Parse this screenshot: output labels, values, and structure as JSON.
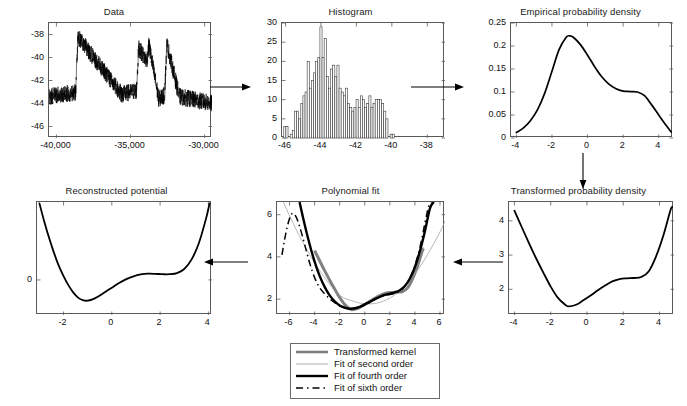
{
  "figure": {
    "kind": "pipeline-figure",
    "background": "#ffffff",
    "line_color": "#000000",
    "axis_color": "#5a5a5a"
  },
  "arrows": [
    {
      "name": "arrow-data-to-histogram",
      "direction": "right"
    },
    {
      "name": "arrow-histogram-to-empirical",
      "direction": "right"
    },
    {
      "name": "arrow-empirical-to-transformed",
      "direction": "down"
    },
    {
      "name": "arrow-transformed-to-polynomial",
      "direction": "left"
    },
    {
      "name": "arrow-polynomial-to-reconstructed",
      "direction": "left"
    }
  ],
  "legend": {
    "name": "polynomial-fit-legend",
    "entries": [
      {
        "label": "Transformed kernel",
        "style": "thick-gray",
        "color": "#777777"
      },
      {
        "label": "Fit of second order",
        "style": "thin-gray",
        "color": "#999999"
      },
      {
        "label": "Fit of fourth order",
        "style": "thick-black",
        "color": "#000000"
      },
      {
        "label": "Fit of sixth order",
        "style": "dashed-black",
        "color": "#000000"
      }
    ]
  },
  "chart_data": [
    {
      "id": "data",
      "type": "line",
      "title": "Data",
      "xlabel": "",
      "ylabel": "",
      "xlim": [
        -40500,
        -29500
      ],
      "ylim": [
        -47,
        -37
      ],
      "xticks": [
        -40000,
        -35000,
        -30000
      ],
      "xticklabels": [
        "-40,000",
        "-35,000",
        "-30,000"
      ],
      "yticks": [
        -46,
        -44,
        -42,
        -40,
        -38
      ],
      "yticklabels": [
        "-46",
        "-44",
        "-42",
        "-40",
        "-38"
      ],
      "grid": false,
      "description": "Noisy bistable time series switching between a lower level near -43.5 and an upper level near -39",
      "noise_amplitude": 0.75,
      "segments": [
        {
          "x0": -40500,
          "x1": -38700,
          "y0": -43.4,
          "y1": -43.0
        },
        {
          "x0": -38700,
          "x1": -38550,
          "y0": -43.0,
          "y1": -38.2
        },
        {
          "x0": -38550,
          "x1": -35600,
          "y0": -38.2,
          "y1": -43.2
        },
        {
          "x0": -35600,
          "x1": -34600,
          "y0": -43.2,
          "y1": -42.9
        },
        {
          "x0": -34600,
          "x1": -34450,
          "y0": -42.9,
          "y1": -39.2
        },
        {
          "x0": -34450,
          "x1": -33900,
          "y0": -39.2,
          "y1": -40.3
        },
        {
          "x0": -33900,
          "x1": -33750,
          "y0": -40.3,
          "y1": -38.9
        },
        {
          "x0": -33750,
          "x1": -33100,
          "y0": -38.9,
          "y1": -43.6
        },
        {
          "x0": -33100,
          "x1": -32700,
          "y0": -43.6,
          "y1": -43.3
        },
        {
          "x0": -32700,
          "x1": -32550,
          "y0": -43.3,
          "y1": -38.8
        },
        {
          "x0": -32550,
          "x1": -31700,
          "y0": -38.8,
          "y1": -43.4
        },
        {
          "x0": -31700,
          "x1": -29500,
          "y0": -43.4,
          "y1": -44.0
        }
      ]
    },
    {
      "id": "histogram",
      "type": "bar",
      "title": "Histogram",
      "xlabel": "",
      "ylabel": "",
      "xlim": [
        -46.2,
        -37.0
      ],
      "ylim": [
        0,
        30
      ],
      "xticks": [
        -46,
        -44,
        -42,
        -40,
        -38
      ],
      "xticklabels": [
        "-46",
        "-44",
        "-42",
        "-40",
        "-38"
      ],
      "yticks": [
        0,
        5,
        10,
        15,
        20,
        25,
        30
      ],
      "yticklabels": [
        "0",
        "5",
        "10",
        "15",
        "20",
        "25",
        "30"
      ],
      "grid": false,
      "bin_width": 0.12,
      "bin_start": -46.1,
      "values": [
        3,
        3,
        0,
        1,
        2,
        7,
        7,
        5,
        9,
        11,
        12,
        20,
        13,
        15,
        17,
        20,
        21,
        29,
        21,
        26,
        16,
        13,
        18,
        19,
        16,
        19,
        13,
        12,
        11,
        13,
        9,
        8,
        7,
        8,
        10,
        8,
        11,
        10,
        8,
        9,
        11,
        8,
        9,
        10,
        10,
        10,
        9,
        7,
        5,
        0,
        1,
        1
      ]
    },
    {
      "id": "empirical-probability-density",
      "type": "line",
      "title": "Empirical probability density",
      "xlabel": "",
      "ylabel": "",
      "xlim": [
        -4.3,
        4.8
      ],
      "ylim": [
        0,
        0.25
      ],
      "xticks": [
        -4,
        -2,
        0,
        2,
        4
      ],
      "xticklabels": [
        "-4",
        "-2",
        "0",
        "2",
        "4"
      ],
      "yticks": [
        0,
        0.05,
        0.1,
        0.15,
        0.2,
        0.25
      ],
      "yticklabels": [
        "0",
        "0.05",
        "0.1",
        "0.15",
        "0.2",
        "0.25"
      ],
      "grid": false,
      "x": [
        -4.0,
        -3.6,
        -3.2,
        -2.8,
        -2.4,
        -2.0,
        -1.6,
        -1.2,
        -1.0,
        -0.8,
        -0.4,
        0.0,
        0.4,
        0.8,
        1.2,
        1.6,
        2.0,
        2.4,
        2.8,
        3.2,
        3.6,
        4.0,
        4.4,
        4.7
      ],
      "y": [
        0.012,
        0.022,
        0.038,
        0.062,
        0.098,
        0.145,
        0.192,
        0.219,
        0.222,
        0.219,
        0.203,
        0.18,
        0.155,
        0.133,
        0.117,
        0.107,
        0.102,
        0.101,
        0.1,
        0.092,
        0.072,
        0.05,
        0.028,
        0.013
      ]
    },
    {
      "id": "transformed-probability-density",
      "type": "line",
      "title": "Transformed probability density",
      "xlabel": "",
      "ylabel": "",
      "xlim": [
        -4.3,
        4.8
      ],
      "ylim": [
        1.25,
        4.55
      ],
      "xticks": [
        -4,
        -2,
        0,
        2,
        4
      ],
      "xticklabels": [
        "-4",
        "-2",
        "0",
        "2",
        "4"
      ],
      "yticks": [
        2,
        3,
        4
      ],
      "yticklabels": [
        "2",
        "3",
        "4"
      ],
      "grid": false,
      "x": [
        -4.0,
        -3.6,
        -3.2,
        -2.8,
        -2.4,
        -2.0,
        -1.6,
        -1.2,
        -1.0,
        -0.6,
        -0.2,
        0.2,
        0.6,
        1.0,
        1.4,
        1.8,
        2.2,
        2.6,
        3.0,
        3.4,
        3.8,
        4.2,
        4.6,
        4.7
      ],
      "y": [
        4.3,
        3.82,
        3.35,
        2.9,
        2.48,
        2.08,
        1.75,
        1.55,
        1.5,
        1.55,
        1.68,
        1.82,
        1.97,
        2.11,
        2.23,
        2.3,
        2.32,
        2.33,
        2.36,
        2.52,
        2.95,
        3.55,
        4.3,
        4.4
      ]
    },
    {
      "id": "polynomial-fit",
      "type": "line",
      "title": "Polynomial fit",
      "xlabel": "",
      "ylabel": "",
      "xlim": [
        -7.0,
        6.4
      ],
      "ylim": [
        1.25,
        6.6
      ],
      "xticks": [
        -6,
        -4,
        -2,
        0,
        2,
        4,
        6
      ],
      "xticklabels": [
        "-6",
        "-4",
        "-2",
        "0",
        "2",
        "4",
        "6"
      ],
      "yticks": [
        2,
        4,
        6
      ],
      "yticklabels": [
        "2",
        "4",
        "6"
      ],
      "grid": false,
      "series": [
        {
          "name": "Transformed kernel",
          "style": "thick-gray",
          "color": "#808080",
          "x": [
            -4.0,
            -3.6,
            -3.2,
            -2.8,
            -2.4,
            -2.0,
            -1.6,
            -1.2,
            -1.0,
            -0.6,
            -0.2,
            0.2,
            0.6,
            1.0,
            1.4,
            1.8,
            2.2,
            2.6,
            3.0,
            3.4,
            3.8,
            4.2,
            4.6,
            4.7
          ],
          "y": [
            4.3,
            3.82,
            3.35,
            2.9,
            2.48,
            2.08,
            1.75,
            1.55,
            1.5,
            1.55,
            1.68,
            1.82,
            1.97,
            2.11,
            2.23,
            2.3,
            2.32,
            2.33,
            2.36,
            2.52,
            2.95,
            3.55,
            4.3,
            4.4
          ]
        },
        {
          "name": "Fit of second order",
          "style": "thin-gray",
          "color": "#9a9a9a",
          "x": [
            -7.0,
            -6.0,
            -5.0,
            -4.0,
            -3.0,
            -2.0,
            -1.0,
            0.0,
            1.0,
            2.0,
            3.0,
            4.0,
            5.0,
            6.0,
            6.4
          ],
          "y": [
            7.3,
            5.95,
            4.75,
            3.72,
            2.86,
            2.18,
            1.92,
            1.78,
            1.82,
            2.05,
            2.5,
            3.2,
            4.1,
            5.18,
            5.7
          ]
        },
        {
          "name": "Fit of fourth order",
          "style": "thick-black",
          "color": "#000000",
          "x": [
            -5.2,
            -4.8,
            -4.4,
            -4.0,
            -3.6,
            -3.2,
            -2.8,
            -2.4,
            -2.0,
            -1.6,
            -1.2,
            -0.8,
            -0.4,
            0.0,
            0.4,
            0.8,
            1.2,
            1.6,
            2.0,
            2.4,
            2.8,
            3.2,
            3.6,
            4.0,
            4.4,
            4.8,
            5.2,
            5.5
          ],
          "y": [
            6.6,
            5.55,
            4.6,
            3.78,
            3.1,
            2.58,
            2.18,
            1.9,
            1.7,
            1.6,
            1.55,
            1.57,
            1.64,
            1.75,
            1.87,
            2.0,
            2.11,
            2.2,
            2.26,
            2.32,
            2.42,
            2.62,
            2.98,
            3.52,
            4.28,
            5.22,
            6.3,
            6.6
          ]
        },
        {
          "name": "Fit of sixth order",
          "style": "dashed-black",
          "color": "#000000",
          "x": [
            -6.6,
            -6.4,
            -6.1,
            -5.8,
            -5.5,
            -5.2,
            -4.8,
            -4.4,
            -4.0,
            -3.6,
            -3.2,
            -2.8,
            -2.4,
            -2.0,
            -1.6,
            -1.2,
            -0.8,
            -0.4,
            0.0,
            0.4,
            0.8,
            1.2,
            1.6,
            2.0,
            2.4,
            2.8,
            3.2,
            3.6,
            4.0,
            4.4,
            4.8,
            5.1,
            5.3
          ],
          "y": [
            4.1,
            4.8,
            5.62,
            6.05,
            5.92,
            5.45,
            4.6,
            3.72,
            3.02,
            2.55,
            2.25,
            2.02,
            1.84,
            1.68,
            1.58,
            1.53,
            1.55,
            1.62,
            1.72,
            1.84,
            1.98,
            2.1,
            2.18,
            2.22,
            2.28,
            2.4,
            2.62,
            3.0,
            3.6,
            4.45,
            5.6,
            6.4,
            6.6
          ]
        }
      ]
    },
    {
      "id": "reconstructed-potential",
      "type": "line",
      "title": "Reconstructed potential",
      "xlabel": "",
      "ylabel": "",
      "xlim": [
        -3.1,
        4.15
      ],
      "ylim": [
        -1.35,
        3.0
      ],
      "xticks": [
        -2,
        0,
        2,
        4
      ],
      "xticklabels": [
        "-2",
        "0",
        "2",
        "4"
      ],
      "yticks": [
        0
      ],
      "yticklabels": [
        "0"
      ],
      "grid": false,
      "x": [
        -3.0,
        -2.8,
        -2.6,
        -2.4,
        -2.2,
        -2.0,
        -1.8,
        -1.6,
        -1.4,
        -1.2,
        -1.0,
        -0.8,
        -0.6,
        -0.4,
        -0.2,
        0.0,
        0.3,
        0.6,
        0.9,
        1.2,
        1.5,
        1.8,
        2.1,
        2.4,
        2.7,
        3.0,
        3.3,
        3.6,
        3.9,
        4.05
      ],
      "y": [
        2.95,
        2.25,
        1.62,
        1.05,
        0.55,
        0.15,
        -0.2,
        -0.48,
        -0.68,
        -0.78,
        -0.8,
        -0.75,
        -0.66,
        -0.54,
        -0.42,
        -0.3,
        -0.12,
        0.03,
        0.14,
        0.21,
        0.24,
        0.235,
        0.22,
        0.22,
        0.26,
        0.42,
        0.78,
        1.4,
        2.35,
        2.95
      ]
    }
  ]
}
